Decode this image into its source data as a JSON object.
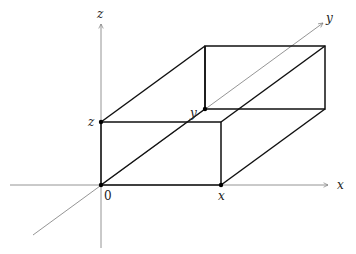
{
  "diagram": {
    "type": "3d-coordinate-box",
    "axes": {
      "x": {
        "label": "x"
      },
      "y": {
        "label": "y"
      },
      "z": {
        "label": "z"
      }
    },
    "points": {
      "origin": {
        "label": "0"
      },
      "x_point": {
        "label": "x"
      },
      "y_point": {
        "label": "y"
      },
      "z_point": {
        "label": "z"
      }
    },
    "colors": {
      "axis": "#7a7a7a",
      "edge": "#111111",
      "text": "#222222"
    }
  }
}
